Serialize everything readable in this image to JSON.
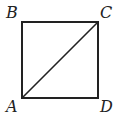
{
  "diagram": {
    "type": "geometry-square-with-diagonal",
    "vertices": [
      {
        "name": "A",
        "label": "A",
        "x": 22,
        "y": 98
      },
      {
        "name": "B",
        "label": "B",
        "x": 22,
        "y": 22
      },
      {
        "name": "C",
        "label": "C",
        "x": 98,
        "y": 22
      },
      {
        "name": "D",
        "label": "D",
        "x": 98,
        "y": 98
      }
    ],
    "segments": [
      {
        "from": "A",
        "to": "B"
      },
      {
        "from": "B",
        "to": "C"
      },
      {
        "from": "C",
        "to": "D"
      },
      {
        "from": "D",
        "to": "A"
      },
      {
        "from": "A",
        "to": "C",
        "role": "diagonal"
      }
    ],
    "stroke_color": "#222222",
    "labels": {
      "A": "A",
      "B": "B",
      "C": "C",
      "D": "D"
    }
  }
}
